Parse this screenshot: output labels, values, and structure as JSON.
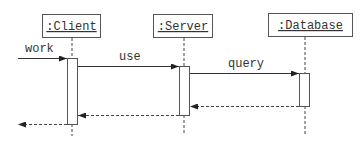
{
  "diagram": {
    "type": "uml-sequence",
    "colors": {
      "line": "#444444",
      "background": "#ffffff",
      "text": "#333333"
    },
    "participants": [
      {
        "id": "client",
        "label": ":Client"
      },
      {
        "id": "server",
        "label": ":Server"
      },
      {
        "id": "database",
        "label": ":Database"
      }
    ],
    "messages": [
      {
        "from": "external",
        "to": "client",
        "label": "work",
        "kind": "call"
      },
      {
        "from": "client",
        "to": "server",
        "label": "use",
        "kind": "call"
      },
      {
        "from": "server",
        "to": "database",
        "label": "query",
        "kind": "call"
      },
      {
        "from": "database",
        "to": "server",
        "label": "",
        "kind": "return"
      },
      {
        "from": "server",
        "to": "client",
        "label": "",
        "kind": "return"
      },
      {
        "from": "client",
        "to": "external",
        "label": "",
        "kind": "return"
      }
    ]
  }
}
